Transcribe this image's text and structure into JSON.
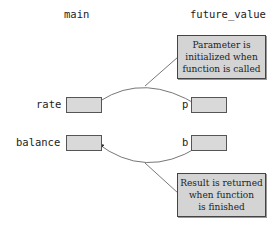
{
  "headers": {
    "left": "main",
    "right": "future_value"
  },
  "variables": {
    "main": [
      {
        "name": "rate"
      },
      {
        "name": "balance"
      }
    ],
    "future_value": [
      {
        "name": "p"
      },
      {
        "name": "b"
      }
    ]
  },
  "callouts": {
    "parameter": {
      "lines": [
        "Parameter is",
        "initialized when",
        "function is called"
      ]
    },
    "result": {
      "lines": [
        "Result is returned",
        "when function",
        "is finished"
      ]
    }
  },
  "colors": {
    "box_fill": "#d9d9d9",
    "callout_fill": "#d4d4d4",
    "line": "#555555"
  }
}
